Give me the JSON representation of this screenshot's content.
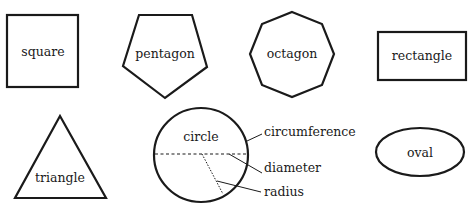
{
  "diagram": {
    "stroke_color": "#1a1a1a",
    "background_color": "#ffffff",
    "shapes": {
      "square": {
        "label": "square"
      },
      "pentagon": {
        "label": "pentagon"
      },
      "octagon": {
        "label": "octagon"
      },
      "rectangle": {
        "label": "rectangle"
      },
      "triangle": {
        "label": "triangle"
      },
      "circle": {
        "label": "circle",
        "parts": {
          "circumference": "circumference",
          "diameter": "diameter",
          "radius": "radius"
        }
      },
      "oval": {
        "label": "oval"
      }
    }
  }
}
